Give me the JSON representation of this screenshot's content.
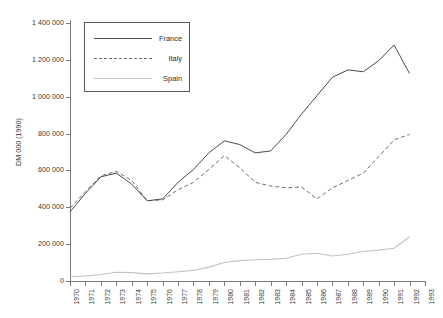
{
  "chart_data": {
    "type": "line",
    "title": "THE ITALIAN ART MARKET",
    "xlabel": "",
    "ylabel": "DM 000 (1990)",
    "xlim": [
      1970,
      1993
    ],
    "ylim": [
      0,
      1400000
    ],
    "ytick_step": 200000,
    "grid": false,
    "legend_position": "top-left",
    "x": [
      1970,
      1971,
      1972,
      1973,
      1974,
      1975,
      1976,
      1977,
      1978,
      1979,
      1980,
      1981,
      1982,
      1983,
      1984,
      1985,
      1986,
      1987,
      1988,
      1989,
      1990,
      1991,
      1992
    ],
    "xtick_labels": [
      "1970",
      "1971",
      "1972",
      "1973",
      "1974",
      "1975",
      "1976",
      "1977",
      "1978",
      "1979",
      "1980",
      "1981",
      "1982",
      "1983",
      "1984",
      "1985",
      "1986",
      "1987",
      "1988",
      "1989",
      "1990",
      "1991",
      "1992",
      "1993"
    ],
    "ytick_labels": [
      "0",
      "200 000",
      "400 000",
      "600 000",
      "800 000",
      "1 000 000",
      "1 200 000",
      "1 400 000"
    ],
    "series": [
      {
        "name": "France",
        "style": "solid",
        "color": "#4a4a4a",
        "values": [
          370000,
          470000,
          560000,
          580000,
          520000,
          430000,
          440000,
          530000,
          600000,
          690000,
          755000,
          735000,
          690000,
          700000,
          790000,
          900000,
          1000000,
          1100000,
          1140000,
          1130000,
          1190000,
          1275000,
          1120000
        ]
      },
      {
        "name": "Italy",
        "style": "dashed",
        "color": "#6e6e6e",
        "values": [
          390000,
          480000,
          565000,
          590000,
          540000,
          430000,
          435000,
          490000,
          530000,
          600000,
          675000,
          610000,
          530000,
          510000,
          500000,
          505000,
          440000,
          500000,
          540000,
          580000,
          670000,
          760000,
          790000
        ]
      },
      {
        "name": "Spain",
        "style": "solid-light",
        "color": "#c2c2c2",
        "values": [
          18000,
          22000,
          30000,
          42000,
          40000,
          33000,
          38000,
          45000,
          52000,
          70000,
          95000,
          105000,
          110000,
          112000,
          118000,
          140000,
          145000,
          130000,
          140000,
          155000,
          162000,
          172000,
          235000
        ]
      }
    ]
  },
  "legend": {
    "items": [
      {
        "label": "France"
      },
      {
        "label": "Italy"
      },
      {
        "label": "Spain"
      }
    ]
  }
}
